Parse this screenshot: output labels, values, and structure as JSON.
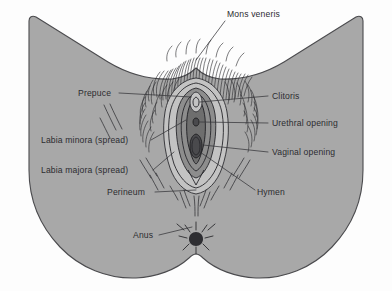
{
  "figure": {
    "background_color": "#fdfdfd",
    "body_fill_color": "#a8a8a8",
    "outline_color": "#4b4b4e",
    "label_color": "#2c2c30"
  },
  "labels": [
    {
      "id": "mons-veneris",
      "text": "Mons veneris",
      "side": "top",
      "text_x": 227,
      "text_y": 17,
      "anchor": "start"
    },
    {
      "id": "prepuce",
      "text": "Prepuce",
      "side": "left",
      "text_x": 78,
      "text_y": 96,
      "anchor": "start"
    },
    {
      "id": "labia-minora",
      "text": "Labia minora (spread)",
      "side": "left",
      "text_x": 41,
      "text_y": 143,
      "anchor": "start"
    },
    {
      "id": "labia-majora",
      "text": "Labia majora (spread)",
      "side": "left",
      "text_x": 41,
      "text_y": 173,
      "anchor": "start"
    },
    {
      "id": "perineum",
      "text": "Perineum",
      "side": "left",
      "text_x": 107,
      "text_y": 195,
      "anchor": "start"
    },
    {
      "id": "anus",
      "text": "Anus",
      "side": "left",
      "text_x": 133,
      "text_y": 238,
      "anchor": "start"
    },
    {
      "id": "clitoris",
      "text": "Clitoris",
      "side": "right",
      "text_x": 272,
      "text_y": 99,
      "anchor": "start"
    },
    {
      "id": "urethral-opening",
      "text": "Urethral opening",
      "side": "right",
      "text_x": 272,
      "text_y": 126,
      "anchor": "start"
    },
    {
      "id": "vaginal-opening",
      "text": "Vaginal opening",
      "side": "right",
      "text_x": 272,
      "text_y": 155,
      "anchor": "start"
    },
    {
      "id": "hymen",
      "text": "Hymen",
      "side": "right",
      "text_x": 257,
      "text_y": 195,
      "anchor": "start"
    }
  ]
}
